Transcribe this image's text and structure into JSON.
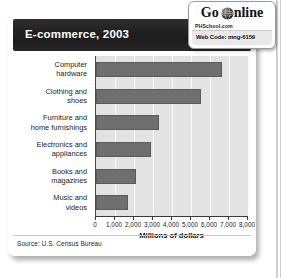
{
  "card": {
    "title": "E-commerce, 2003",
    "source": "Source: U.S. Census Bureau"
  },
  "badge": {
    "go_label": "Go",
    "online_label": "nline",
    "globe_icon": "globe-icon",
    "site": "PHSchool.com",
    "web_code": "Web Code: mng-6159"
  },
  "colors": {
    "header_bg": "#1c1c1c",
    "header_text": "#ffffff",
    "bar_fill": "#6f6f6f",
    "plot_bg": "#e3e3e3",
    "gridline": "#fbfbfb"
  },
  "chart_data": {
    "type": "bar",
    "orientation": "horizontal",
    "title": "E-commerce, 2003",
    "xlabel": "Millions of dollars",
    "ylabel": "",
    "xlim": [
      0,
      8000
    ],
    "grid": true,
    "legend": null,
    "source": "Source: U.S. Census Bureau",
    "xticks": [
      0,
      1000,
      2000,
      3000,
      4000,
      5000,
      6000,
      7000,
      8000
    ],
    "xticklabels": [
      "0",
      "1,000",
      "2,000",
      "3,000",
      "4,000",
      "5,000",
      "6,000",
      "7,000",
      "8,000"
    ],
    "categories": [
      "Computer hardware",
      "Clothing and shoes",
      "Furniture and home furnishings",
      "Electronics and appliances",
      "Books and magazines",
      "Music and videos"
    ],
    "category_lines": [
      [
        "Computer",
        "hardware"
      ],
      [
        "Clothing and",
        "shoes"
      ],
      [
        "Furniture and",
        "home furnishings"
      ],
      [
        "Electronics and",
        "appliances"
      ],
      [
        "Books and",
        "magazines"
      ],
      [
        "Music and",
        "videos"
      ]
    ],
    "values": [
      6650,
      5500,
      3300,
      2900,
      2100,
      1700
    ],
    "units": "millions of dollars"
  }
}
